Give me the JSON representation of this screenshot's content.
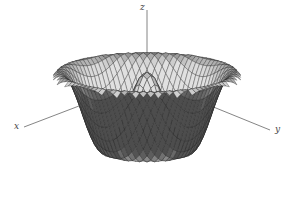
{
  "chart_data": {
    "type": "surface3d",
    "title": "",
    "function": "z = cos(sqrt(x^2 + y^2))",
    "axes": {
      "x_label": "x",
      "y_label": "y",
      "z_label": "z"
    },
    "domain": {
      "x": [
        -6.5,
        6.5
      ],
      "y": [
        -6.5,
        6.5
      ]
    },
    "grid_lines": 34,
    "view": "isometric-like, x axis to lower-left, y axis to lower-right, z up",
    "features": [
      "central peak",
      "ring of ridges",
      "dark shaded back faces",
      "light front faces"
    ],
    "colors": {
      "dark": "#555555",
      "light": "#d8d8d8",
      "mesh": "#222222"
    }
  }
}
